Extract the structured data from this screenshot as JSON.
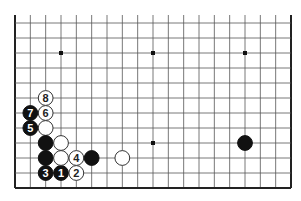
{
  "diagram": {
    "type": "go-board-partial",
    "board_size": 19,
    "visible_rows_from_bottom": 12,
    "open_edge": "top",
    "colors": {
      "background": "#ffffff",
      "grid_line": "#555555",
      "edge_line": "#222222",
      "black_stone": "#111111",
      "white_stone": "#ffffff",
      "white_stone_border": "#333333",
      "black_label": "#ffffff",
      "white_label": "#222222"
    },
    "star_points": [
      {
        "col": 3,
        "row": 9
      },
      {
        "col": 9,
        "row": 9
      },
      {
        "col": 15,
        "row": 9
      },
      {
        "col": 3,
        "row": 3
      },
      {
        "col": 9,
        "row": 3
      },
      {
        "col": 15,
        "row": 3
      }
    ],
    "stones": [
      {
        "color": "black",
        "col": 3,
        "row": 1,
        "label": "1"
      },
      {
        "color": "white",
        "col": 4,
        "row": 1,
        "label": "2"
      },
      {
        "color": "black",
        "col": 2,
        "row": 1,
        "label": "3"
      },
      {
        "color": "white",
        "col": 4,
        "row": 2,
        "label": "4"
      },
      {
        "color": "black",
        "col": 1,
        "row": 4,
        "label": "5"
      },
      {
        "color": "white",
        "col": 2,
        "row": 5,
        "label": "6"
      },
      {
        "color": "black",
        "col": 1,
        "row": 5,
        "label": "7"
      },
      {
        "color": "white",
        "col": 2,
        "row": 6,
        "label": "8"
      },
      {
        "color": "white",
        "col": 2,
        "row": 4,
        "label": ""
      },
      {
        "color": "black",
        "col": 2,
        "row": 3,
        "label": ""
      },
      {
        "color": "white",
        "col": 3,
        "row": 3,
        "label": ""
      },
      {
        "color": "black",
        "col": 2,
        "row": 2,
        "label": ""
      },
      {
        "color": "white",
        "col": 3,
        "row": 2,
        "label": ""
      },
      {
        "color": "black",
        "col": 5,
        "row": 2,
        "label": ""
      },
      {
        "color": "white",
        "col": 7,
        "row": 2,
        "label": ""
      },
      {
        "color": "black",
        "col": 15,
        "row": 3,
        "label": ""
      }
    ]
  }
}
